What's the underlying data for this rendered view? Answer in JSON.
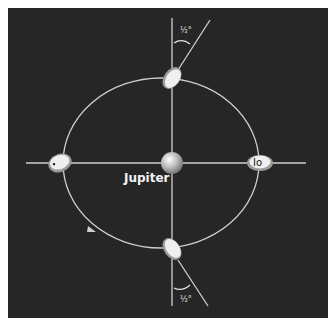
{
  "diagram": {
    "central_body": {
      "label": "Jupiter"
    },
    "moon": {
      "label": "Io"
    },
    "angle_annotations": [
      {
        "position": "top",
        "label": "½°"
      },
      {
        "position": "bottom",
        "label": "½°"
      }
    ],
    "orbit_direction": "counterclockwise-arrow",
    "colors": {
      "background": "#262626",
      "lines": "#cfcfcf",
      "moon_body": "#efefef",
      "moon_shadow": "#9a9a9a"
    }
  }
}
